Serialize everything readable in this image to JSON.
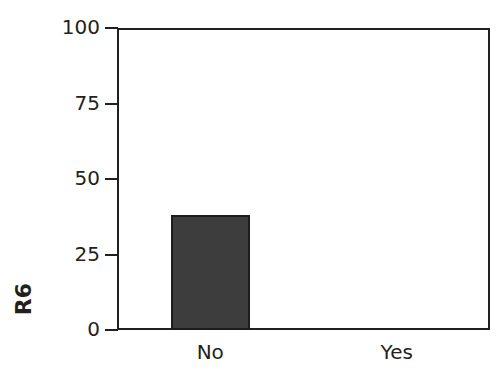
{
  "chart_data": {
    "type": "bar",
    "title": "",
    "xlabel": "",
    "ylabel": "R6",
    "categories": [
      "No",
      "Yes"
    ],
    "values": [
      38,
      0
    ],
    "series": [
      {
        "name": "R6",
        "values": [
          38,
          0
        ]
      }
    ],
    "ylim": [
      0,
      100
    ],
    "yticks": [
      0,
      25,
      50,
      75,
      100
    ],
    "ytick_labels": [
      "0",
      "25",
      "50",
      "75",
      "100"
    ],
    "grid": false,
    "legend": false,
    "bar_color": "#3d3d3d",
    "bar_edge_color": "#1c1c1c",
    "axis_color": "#231f20",
    "background_color": "#ffffff"
  },
  "axis": {
    "y_label": "R6",
    "ticks": [
      {
        "label": "100",
        "value": 100
      },
      {
        "label": "75",
        "value": 75
      },
      {
        "label": "50",
        "value": 50
      },
      {
        "label": "25",
        "value": 25
      },
      {
        "label": "0",
        "value": 0
      }
    ],
    "categories": [
      {
        "label": "No",
        "value": 38
      },
      {
        "label": "Yes",
        "value": 0
      }
    ]
  }
}
